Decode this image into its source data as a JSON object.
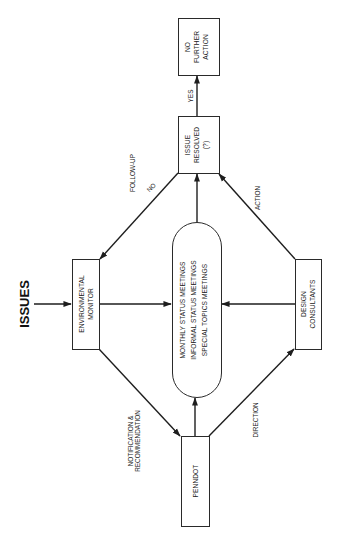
{
  "diagram": {
    "title": "ISSUES",
    "orientation": "rotated-90-ccw",
    "nodes": {
      "no_further_action": [
        "NO",
        "FURTHER",
        "ACTION"
      ],
      "issue_resolved": [
        "ISSUE",
        "RESOLVED",
        "(?)"
      ],
      "environmental_monitor": [
        "ENVIRONMENTAL",
        "MONITOR"
      ],
      "meetings": [
        "MONTHLY STATUS MEETINGS",
        "INFORMAL STATUS MEETINGS",
        "SPECIAL TOPICS MEETINGS"
      ],
      "design_consultants": [
        "DESIGN",
        "CONSULTANTS"
      ],
      "penndot": [
        "PENNDOT"
      ]
    },
    "edges": {
      "yes": "YES",
      "no": "NO",
      "follow_up": "FOLLOW-UP",
      "action": "ACTION",
      "direction": "DIRECTION",
      "notification": [
        "NOTIFICATION &",
        "RECOMMENDATION"
      ]
    }
  }
}
